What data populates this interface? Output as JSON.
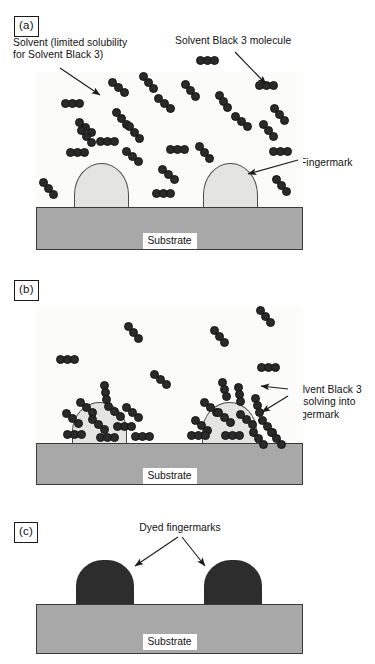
{
  "figure": {
    "colors": {
      "substrate": "#a8a8a8",
      "solvent_field": "#fbfbfa",
      "fingermark": "#e4e4e2",
      "molecule": "#2a2a2a",
      "dyed_fingermark": "#2d2d2d",
      "outline": "#3a3a3a",
      "text": "#111111"
    }
  },
  "panels": [
    {
      "tag": "(a)",
      "labels": [
        {
          "name": "solvent-label",
          "text": "Solvent (limited solubility\nfor Solvent Black 3)"
        },
        {
          "name": "molecule-label",
          "text": "Solvent Black 3 molecule"
        },
        {
          "name": "fingermark-label",
          "text": "Fingermark"
        }
      ],
      "substrate_label": "Substrate",
      "fingermark_count": 2,
      "molecule_count": 25,
      "description": "Solvent Black 3 molecules dispersed in solvent above two undyed fingermark ridges on a substrate"
    },
    {
      "tag": "(b)",
      "labels": [
        {
          "name": "dissolving-label",
          "text": "Solvent Black 3\ndissolving into\nfingermark"
        }
      ],
      "substrate_label": "Substrate",
      "fingermark_count": 2,
      "molecule_count": 30,
      "description": "Solvent Black 3 molecules accumulating at and dissolving into the fingermark ridges"
    },
    {
      "tag": "(c)",
      "labels": [
        {
          "name": "dyed-fingermarks-label",
          "text": "Dyed fingermarks"
        }
      ],
      "substrate_label": "Substrate",
      "fingermark_count": 2,
      "molecule_count": 0,
      "description": "Two fully dyed (dark) fingermark ridges remaining on the substrate"
    }
  ]
}
